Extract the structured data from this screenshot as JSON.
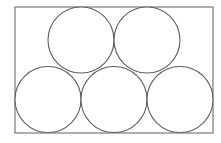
{
  "figure": {
    "type": "geometric-diagram",
    "canvas": {
      "width": 221,
      "height": 143,
      "background_color": "#fdfdfd"
    },
    "container": {
      "shape": "rectangle",
      "x": 15,
      "y": 7,
      "width": 198,
      "height": 126,
      "stroke_color": "#6e6e6e",
      "stroke_width": 1.1,
      "fill_color": "#ffffff"
    },
    "circle_style": {
      "stroke_color": "#5f5f5f",
      "stroke_width": 1.1,
      "fill_color": "#ffffff",
      "radius": 33
    },
    "circles": [
      {
        "id": "top-left-circle",
        "row": "top",
        "cx": 81,
        "cy": 40,
        "r": 33
      },
      {
        "id": "top-right-circle",
        "row": "top",
        "cx": 147,
        "cy": 40,
        "r": 33
      },
      {
        "id": "bottom-left-circle",
        "row": "bottom",
        "cx": 48,
        "cy": 99.5,
        "r": 33
      },
      {
        "id": "bottom-center-circle",
        "row": "bottom",
        "cx": 114,
        "cy": 99.5,
        "r": 33
      },
      {
        "id": "bottom-right-circle",
        "row": "bottom",
        "cx": 180,
        "cy": 99.5,
        "r": 33
      }
    ],
    "counts": {
      "total_circles": 5,
      "top_row": 2,
      "bottom_row": 3
    }
  }
}
